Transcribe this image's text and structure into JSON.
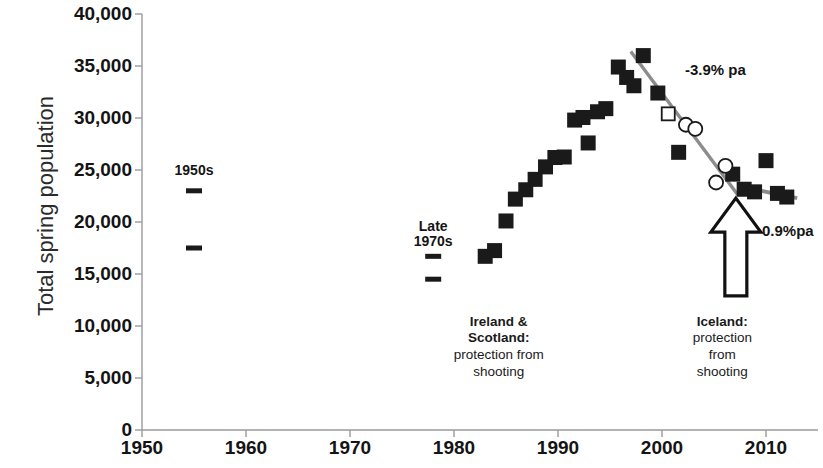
{
  "chart_data": {
    "type": "scatter",
    "title": "",
    "xlabel": "",
    "ylabel": "Total spring population",
    "xlim": [
      1950,
      2015
    ],
    "ylim": [
      0,
      40000
    ],
    "grid": false,
    "legend": "none",
    "ytick_labels": [
      "40,000",
      "35,000",
      "30,000",
      "25,000",
      "20,000",
      "15,000",
      "10,000",
      "5,000",
      "0"
    ],
    "ytick_values": [
      40000,
      35000,
      30000,
      25000,
      20000,
      15000,
      10000,
      5000,
      0
    ],
    "xtick_labels": [
      "1950",
      "1960",
      "1970",
      "1980",
      "1990",
      "2000",
      "2010"
    ],
    "xtick_values": [
      1950,
      1960,
      1970,
      1980,
      1990,
      2000,
      2010
    ],
    "series": [
      {
        "name": "Counted spring population (filled square)",
        "marker": "filled-square",
        "points": [
          {
            "x": 1983.0,
            "y": 16700
          },
          {
            "x": 1983.9,
            "y": 17250
          },
          {
            "x": 1985.0,
            "y": 20100
          },
          {
            "x": 1985.9,
            "y": 22200
          },
          {
            "x": 1986.9,
            "y": 23100
          },
          {
            "x": 1987.8,
            "y": 24100
          },
          {
            "x": 1988.8,
            "y": 25300
          },
          {
            "x": 1989.7,
            "y": 26200
          },
          {
            "x": 1990.6,
            "y": 26250
          },
          {
            "x": 1991.6,
            "y": 29800
          },
          {
            "x": 1992.4,
            "y": 30050
          },
          {
            "x": 1992.9,
            "y": 27600
          },
          {
            "x": 1993.8,
            "y": 30600
          },
          {
            "x": 1994.6,
            "y": 30900
          },
          {
            "x": 1995.8,
            "y": 34900
          },
          {
            "x": 1996.6,
            "y": 33900
          },
          {
            "x": 1997.3,
            "y": 33100
          },
          {
            "x": 1998.2,
            "y": 36000
          },
          {
            "x": 1999.6,
            "y": 32400
          },
          {
            "x": 2001.6,
            "y": 26700
          },
          {
            "x": 2006.8,
            "y": 24600
          },
          {
            "x": 2007.9,
            "y": 23150
          },
          {
            "x": 2008.9,
            "y": 22900
          },
          {
            "x": 2010.0,
            "y": 25900
          },
          {
            "x": 2011.1,
            "y": 22750
          },
          {
            "x": 2012.0,
            "y": 22400
          }
        ]
      },
      {
        "name": "Estimated population (open square)",
        "marker": "open-square",
        "points": [
          {
            "x": 2000.6,
            "y": 30400
          }
        ]
      },
      {
        "name": "Estimated population (open circle)",
        "marker": "open-circle",
        "points": [
          {
            "x": 2002.3,
            "y": 29350
          },
          {
            "x": 2003.2,
            "y": 28950
          },
          {
            "x": 2005.2,
            "y": 23800
          },
          {
            "x": 2006.1,
            "y": 25400
          }
        ]
      }
    ],
    "range_markers": [
      {
        "label_group": "1950s",
        "x": 1955.0,
        "y": 23000
      },
      {
        "label_group": "1950s",
        "x": 1955.0,
        "y": 17500
      },
      {
        "label_group": "Late 1970s",
        "x": 1978.0,
        "y": 16700
      },
      {
        "label_group": "Late 1970s",
        "x": 1978.0,
        "y": 14500
      }
    ],
    "trend_lines": [
      {
        "label": "-3.9% pa",
        "x1": 1997.0,
        "y1": 36400,
        "x2": 2007.3,
        "y2": 22600
      },
      {
        "label": "-0.9%pa",
        "x1": 2007.3,
        "y1": 23450,
        "x2": 2013.0,
        "y2": 22300
      }
    ],
    "era_labels": [
      {
        "text": "1950s",
        "x": 1955.0,
        "y": 25800
      },
      {
        "text": "Late",
        "x": 1978.0,
        "y": 20400
      },
      {
        "text": "1970s",
        "x": 1978.0,
        "y": 18900
      }
    ],
    "annotations": [
      {
        "name": "ireland-scotland-note",
        "heading_lines": [
          "Ireland &",
          "Scotland:"
        ],
        "body_lines": [
          "protection from",
          "shooting"
        ],
        "x": 1984.3,
        "y": 11200
      },
      {
        "name": "iceland-note",
        "heading_lines": [
          "Iceland:"
        ],
        "body_lines": [
          "protection",
          "from",
          "shooting"
        ],
        "x": 2005.8,
        "y": 11200
      }
    ],
    "arrow": {
      "name": "iceland-protection-arrow",
      "x": 2007.1,
      "y_tip": 22300,
      "y_base": 12900
    },
    "colors": {
      "marker_fill": "#1a1a1a",
      "marker_open_stroke": "#1a1a1a",
      "trend_line": "#8c8c8c",
      "axis": "#9a9a9a",
      "text": "#141414"
    }
  }
}
